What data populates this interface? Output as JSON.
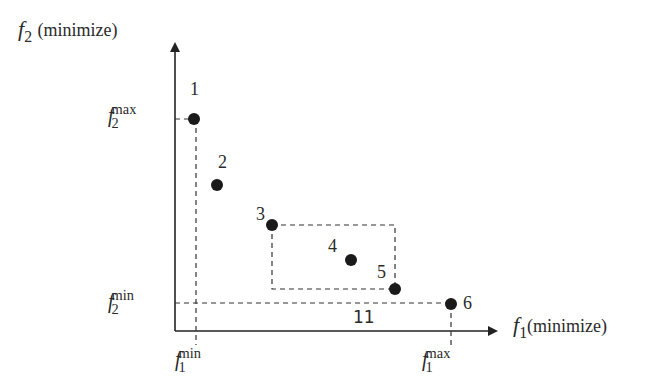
{
  "diagram": {
    "type": "pareto-front",
    "y_axis": {
      "symbol": "f",
      "index": "2",
      "label": "(minimize)"
    },
    "x_axis": {
      "symbol": "f",
      "index": "1",
      "label": "(minimize)"
    },
    "ticks": {
      "f2_max": {
        "symbol": "f",
        "index": "2",
        "sup": "max"
      },
      "f2_min": {
        "symbol": "f",
        "index": "2",
        "sup": "min"
      },
      "f1_min": {
        "symbol": "f",
        "index": "1",
        "sup": "min"
      },
      "f1_max": {
        "symbol": "f",
        "index": "1",
        "sup": "max"
      }
    },
    "points": [
      {
        "label": "1",
        "x": 194,
        "y": 119
      },
      {
        "label": "2",
        "x": 217,
        "y": 185
      },
      {
        "label": "3",
        "x": 272,
        "y": 225
      },
      {
        "label": "4",
        "x": 351,
        "y": 260
      },
      {
        "label": "5",
        "x": 395,
        "y": 289
      },
      {
        "label": "6",
        "x": 451,
        "y": 304
      }
    ],
    "region_label": "11",
    "colors": {
      "ink": "#222222",
      "background": "#ffffff"
    }
  }
}
